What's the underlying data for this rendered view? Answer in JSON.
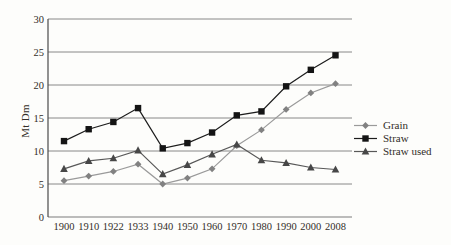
{
  "colors": {
    "background": "#fdfdfb",
    "grid": "#7c7c7c",
    "axis": "#4a4a4a",
    "text": "#332e29"
  },
  "chart_data": {
    "type": "line",
    "title": "",
    "xlabel": "",
    "ylabel": "Mt Dm",
    "ylim": [
      0,
      30
    ],
    "yticks": [
      0,
      5,
      10,
      15,
      20,
      25,
      30
    ],
    "grid": true,
    "legend_position": "right",
    "categories": [
      "1900",
      "1910",
      "1922",
      "1933",
      "1940",
      "1950",
      "1960",
      "1970",
      "1980",
      "1990",
      "2000",
      "2008"
    ],
    "series": [
      {
        "name": "Grain",
        "marker": "diamond",
        "color": "#9a9a9a",
        "marker_color": "#818181",
        "values": [
          5.5,
          6.2,
          6.9,
          8.0,
          5.0,
          5.9,
          7.3,
          10.8,
          13.2,
          16.3,
          18.8,
          20.2
        ]
      },
      {
        "name": "Straw",
        "marker": "square",
        "color": "#1c1c1c",
        "marker_color": "#141414",
        "values": [
          11.5,
          13.3,
          14.4,
          16.5,
          10.4,
          11.2,
          12.8,
          15.4,
          16.0,
          19.8,
          22.3,
          24.5
        ]
      },
      {
        "name": "Straw used",
        "marker": "triangle",
        "color": "#585858",
        "marker_color": "#474747",
        "values": [
          7.3,
          8.5,
          8.9,
          10.1,
          6.5,
          7.9,
          9.5,
          11.0,
          8.6,
          8.2,
          7.5,
          7.2
        ]
      }
    ]
  }
}
